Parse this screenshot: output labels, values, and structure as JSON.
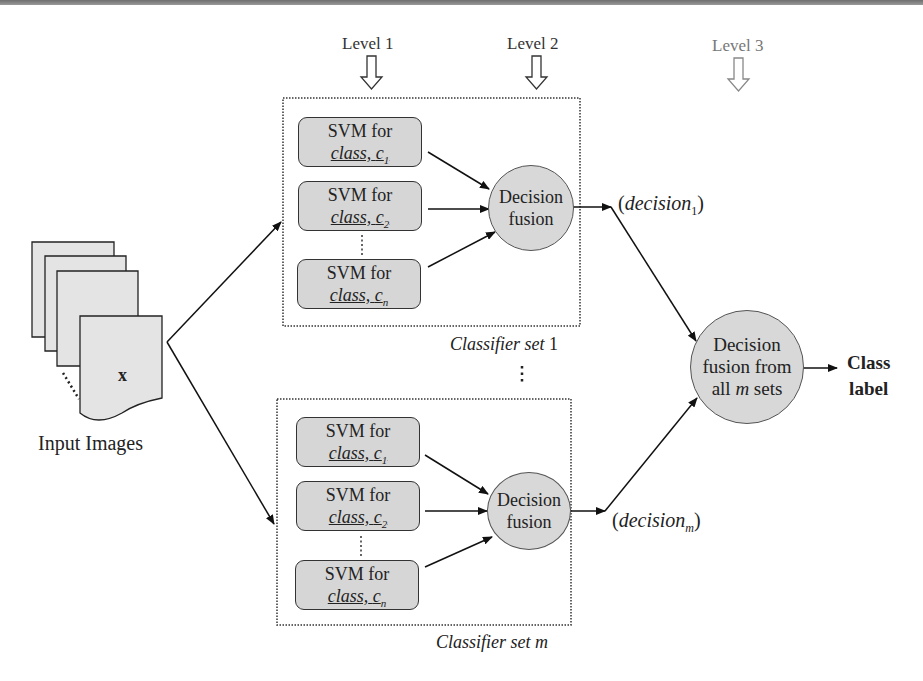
{
  "levels": [
    {
      "label": "Level 1"
    },
    {
      "label": "Level 2"
    },
    {
      "label": "Level 3"
    }
  ],
  "input": {
    "label": "Input Images",
    "symbol": "x"
  },
  "classifier_sets": [
    {
      "caption_prefix": "Classifier set",
      "caption_index": "1",
      "svms": [
        {
          "line1": "SVM for",
          "line2": "class,",
          "var": "c",
          "sub": "1"
        },
        {
          "line1": "SVM for",
          "line2": "class,",
          "var": "c",
          "sub": "2"
        },
        {
          "line1": "SVM for",
          "line2": "class,",
          "var": "c",
          "sub": "n"
        }
      ],
      "fusion": {
        "line1": "Decision",
        "line2": "fusion"
      },
      "output": {
        "open": "(",
        "word": "decision",
        "sub": "1",
        "close": ")"
      }
    },
    {
      "caption_prefix": "Classifier set",
      "caption_index": "m",
      "svms": [
        {
          "line1": "SVM for",
          "line2": "class,",
          "var": "c",
          "sub": "1"
        },
        {
          "line1": "SVM for",
          "line2": "class,",
          "var": "c",
          "sub": "2"
        },
        {
          "line1": "SVM for",
          "line2": "class,",
          "var": "c",
          "sub": "n"
        }
      ],
      "fusion": {
        "line1": "Decision",
        "line2": "fusion"
      },
      "output": {
        "open": "(",
        "word": "decision",
        "sub": "m",
        "close": ")"
      }
    }
  ],
  "final_fusion": {
    "line1": "Decision",
    "line2": "fusion from",
    "line3_pre": "all ",
    "line3_var": "m",
    "line3_post": " sets"
  },
  "result": {
    "line1": "Class",
    "line2": "label"
  },
  "colors": {
    "box_fill": "#d6d6d6",
    "circle_fill": "#d8d8d8",
    "stroke": "#333333",
    "level3": "#777777"
  }
}
